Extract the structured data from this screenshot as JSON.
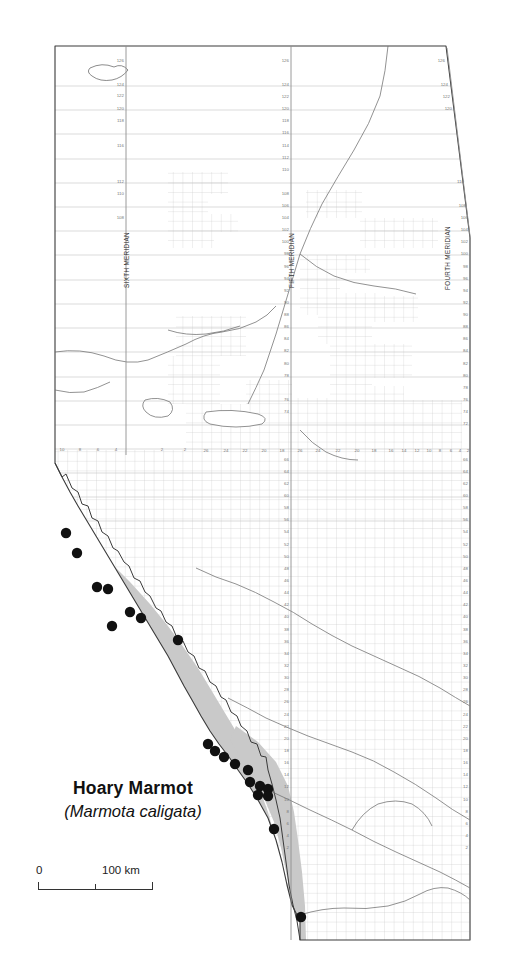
{
  "figure": {
    "type": "species-distribution-map",
    "region": "Alberta, Canada",
    "species_common_name": "Hoary Marmot",
    "species_scientific_name": "(Marmota caligata)"
  },
  "scale_bar": {
    "min_label": "0",
    "max_label": "100 km",
    "units": "km",
    "length_km": 100
  },
  "meridians": [
    {
      "id": "sixth",
      "label": "SIXTH MERIDIAN",
      "x": 126
    },
    {
      "id": "fifth",
      "label": "FIFTH MERIDIAN",
      "x": 291
    },
    {
      "id": "fourth",
      "label": "FOURTH MERIDIAN",
      "x": 447
    }
  ],
  "township_labels_sixth": [
    "126",
    "124",
    "122",
    "120",
    "118",
    "116",
    "112",
    "110",
    "108"
  ],
  "township_labels_fifth": [
    "126",
    "124",
    "122",
    "120",
    "118",
    "116",
    "114",
    "112",
    "110",
    "108",
    "106",
    "104",
    "102",
    "100",
    "98",
    "96",
    "94",
    "92",
    "90",
    "88",
    "86",
    "84",
    "82",
    "80",
    "78",
    "76",
    "74"
  ],
  "township_labels_fourth": [
    "126",
    "124",
    "122",
    "120",
    "110",
    "108",
    "106",
    "104",
    "102",
    "100",
    "98",
    "96",
    "94",
    "92",
    "90",
    "88",
    "86",
    "84",
    "82",
    "80",
    "78",
    "76",
    "74",
    "72"
  ],
  "township_labels_south_west": [
    "66",
    "64",
    "62",
    "60",
    "58",
    "56",
    "54",
    "52",
    "50",
    "48",
    "46",
    "44",
    "42",
    "40",
    "38",
    "36",
    "34",
    "32",
    "30",
    "28",
    "26",
    "24",
    "22",
    "20",
    "18",
    "16",
    "14",
    "12",
    "10",
    "8",
    "6",
    "4",
    "2"
  ],
  "range_labels_west_of_fifth": [
    "10",
    "8",
    "6",
    "4",
    "2"
  ],
  "range_labels_west_of_fourth": [
    "26",
    "24",
    "22",
    "20",
    "18",
    "16",
    "14",
    "12",
    "10",
    "8",
    "6",
    "4",
    "2"
  ],
  "colors": {
    "range_fill": "#c9c9c9",
    "occurrence_dot": "#111111",
    "province_outline": "#3a3a3a",
    "township_grid": "#b9b9b9",
    "hydrography": "#6e6e6e",
    "background": "#ffffff"
  },
  "legend": {
    "range_shading_meaning": "known / estimated range",
    "dot_meaning": "occurrence record"
  },
  "occurrence_points": [
    {
      "x": 66,
      "y": 533
    },
    {
      "x": 77,
      "y": 553
    },
    {
      "x": 97,
      "y": 587
    },
    {
      "x": 112,
      "y": 626
    },
    {
      "x": 108,
      "y": 589
    },
    {
      "x": 130,
      "y": 612
    },
    {
      "x": 141,
      "y": 618
    },
    {
      "x": 178,
      "y": 640
    },
    {
      "x": 208,
      "y": 744
    },
    {
      "x": 215,
      "y": 751
    },
    {
      "x": 224,
      "y": 757
    },
    {
      "x": 235,
      "y": 764
    },
    {
      "x": 248,
      "y": 770
    },
    {
      "x": 250,
      "y": 782
    },
    {
      "x": 260,
      "y": 786
    },
    {
      "x": 268,
      "y": 789
    },
    {
      "x": 258,
      "y": 795
    },
    {
      "x": 268,
      "y": 796
    },
    {
      "x": 274,
      "y": 829
    },
    {
      "x": 301,
      "y": 917
    }
  ],
  "chart_data": {
    "type": "map",
    "title": "Hoary Marmot",
    "subtitle": "(Marmota caligata)",
    "series": [
      {
        "name": "Occurrence records",
        "marker": "filled-circle",
        "count": 20
      },
      {
        "name": "Range",
        "marker": "gray-polygon",
        "description": "Continuous band along the Rocky Mountains on the southwestern border of Alberta"
      }
    ],
    "xlabel": "",
    "ylabel": ""
  }
}
